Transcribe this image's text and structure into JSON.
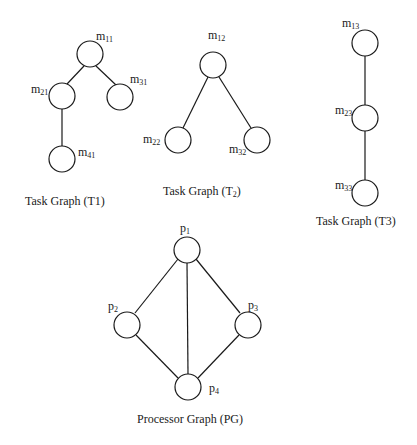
{
  "colors": {
    "stroke": "#1a1a1a",
    "background": "#ffffff"
  },
  "graphs": {
    "t1": {
      "caption": {
        "prefix": "Task Graph (T",
        "sub": "",
        "main": "1",
        "suffix": ")"
      },
      "nodes": {
        "m11": {
          "base": "m",
          "sub": "11"
        },
        "m21": {
          "base": "m",
          "sub": "21"
        },
        "m31": {
          "base": "m",
          "sub": "31"
        },
        "m41": {
          "base": "m",
          "sub": "41"
        }
      },
      "edges": [
        [
          "m11",
          "m21"
        ],
        [
          "m11",
          "m31"
        ],
        [
          "m21",
          "m41"
        ]
      ]
    },
    "t2": {
      "caption": {
        "prefix": "Task Graph (T",
        "sub": "2",
        "suffix": ")"
      },
      "nodes": {
        "m12": {
          "base": "m",
          "sub": "12"
        },
        "m22": {
          "base": "m",
          "sub": "22"
        },
        "m32": {
          "base": "m",
          "sub": "32"
        }
      },
      "edges": [
        [
          "m12",
          "m22"
        ],
        [
          "m12",
          "m32"
        ]
      ]
    },
    "t3": {
      "caption": {
        "prefix": "Task Graph (T",
        "main": "3",
        "suffix": ")"
      },
      "nodes": {
        "m13": {
          "base": "m",
          "sub": "13"
        },
        "m23": {
          "base": "m",
          "sub": "23"
        },
        "m33": {
          "base": "m",
          "sub": "33"
        }
      },
      "edges": [
        [
          "m13",
          "m23"
        ],
        [
          "m23",
          "m33"
        ]
      ]
    },
    "pg": {
      "caption": {
        "text": "Processor Graph (PG)"
      },
      "nodes": {
        "p1": {
          "base": "p",
          "sub": "1"
        },
        "p2": {
          "base": "p",
          "sub": "2"
        },
        "p3": {
          "base": "p",
          "sub": "3"
        },
        "p4": {
          "base": "p",
          "sub": "4"
        }
      },
      "edges": [
        [
          "p1",
          "p2"
        ],
        [
          "p1",
          "p3"
        ],
        [
          "p1",
          "p4"
        ],
        [
          "p2",
          "p4"
        ],
        [
          "p3",
          "p4"
        ]
      ]
    }
  }
}
